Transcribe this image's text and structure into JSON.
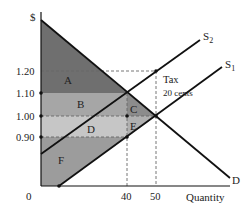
{
  "diagram": {
    "y_axis_label": "$",
    "x_axis_label": "Quantity",
    "origin_label": "0",
    "price_ticks": [
      "1.20",
      "1.10",
      "1.00",
      "0.90"
    ],
    "quantity_ticks": [
      "40",
      "50"
    ],
    "curves": {
      "demand": "D",
      "supply_original": "S",
      "supply_original_sub": "1",
      "supply_taxed": "S",
      "supply_taxed_sub": "2"
    },
    "annotation": {
      "line1": "Tax",
      "line2": "20 cents"
    },
    "regions": {
      "A": "A",
      "B": "B",
      "C": "C",
      "D": "D",
      "E": "E",
      "F": "F"
    },
    "colors": {
      "region_A": "#6f6f6f",
      "region_B": "#a6a6a6",
      "region_C": "#8c8c8c",
      "region_D": "#c6c6c6",
      "region_E": "#b0b0b0",
      "region_F": "#9c9c9c",
      "line": "#111111",
      "dashed": "#666666"
    }
  }
}
